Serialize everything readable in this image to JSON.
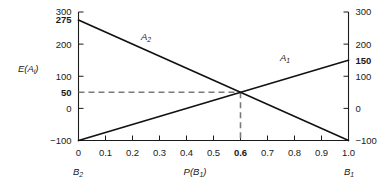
{
  "chart_data": {
    "type": "line",
    "title": "",
    "xlabel": "P(B1)",
    "ylabel": "E(Ai)",
    "xlim": [
      0,
      1.0
    ],
    "ylim": [
      -100,
      300
    ],
    "grid": false,
    "legend_position": "inline-annotation",
    "x": [
      0,
      1.0
    ],
    "series": [
      {
        "name": "A1",
        "values": [
          -100,
          150
        ]
      },
      {
        "name": "A2",
        "values": [
          275,
          -100
        ]
      }
    ],
    "annotations": [
      {
        "label": "intersection",
        "x": 0.6,
        "y": 50
      }
    ]
  },
  "axes": {
    "y_left": {
      "label": "E(A",
      "label_sub": "i",
      "label_close": ")",
      "ticks": [
        {
          "value": 300,
          "text": "300",
          "bold": false
        },
        {
          "value": 275,
          "text": "275",
          "bold": true
        },
        {
          "value": 200,
          "text": "200",
          "bold": false
        },
        {
          "value": 100,
          "text": "100",
          "bold": false
        },
        {
          "value": 50,
          "text": "50",
          "bold": true
        },
        {
          "value": 0,
          "text": "0",
          "bold": false
        },
        {
          "value": -100,
          "text": "−100",
          "bold": false
        }
      ]
    },
    "y_right": {
      "ticks": [
        {
          "value": 300,
          "text": "300",
          "bold": false
        },
        {
          "value": 200,
          "text": "200",
          "bold": false
        },
        {
          "value": 150,
          "text": "150",
          "bold": true
        },
        {
          "value": 100,
          "text": "100",
          "bold": false
        },
        {
          "value": 0,
          "text": "0",
          "bold": false
        },
        {
          "value": -100,
          "text": "−100",
          "bold": false
        }
      ]
    },
    "x_bottom": {
      "label": "P(B",
      "label_sub": "1",
      "label_close": ")",
      "ticks": [
        {
          "value": 0.0,
          "text": "0",
          "bold": false
        },
        {
          "value": 0.1,
          "text": "0.1",
          "bold": false
        },
        {
          "value": 0.2,
          "text": "0.2",
          "bold": false
        },
        {
          "value": 0.3,
          "text": "0.3",
          "bold": false
        },
        {
          "value": 0.4,
          "text": "0.4",
          "bold": false
        },
        {
          "value": 0.5,
          "text": "0.5",
          "bold": false
        },
        {
          "value": 0.6,
          "text": "0.6",
          "bold": true
        },
        {
          "value": 0.7,
          "text": "0.7",
          "bold": false
        },
        {
          "value": 0.8,
          "text": "0.8",
          "bold": false
        },
        {
          "value": 0.9,
          "text": "0.9",
          "bold": false
        },
        {
          "value": 1.0,
          "text": "1.0",
          "bold": false
        }
      ],
      "left_end_label": "B",
      "left_end_sub": "2",
      "right_end_label": "B",
      "right_end_sub": "1"
    }
  },
  "curve_labels": {
    "a2": {
      "base": "A",
      "sub": "2"
    },
    "a1": {
      "base": "A",
      "sub": "1"
    }
  },
  "colors": {
    "line": "#111111",
    "guide": "#7a7a7a",
    "axis": "#1a1a1a",
    "background": "#ffffff"
  }
}
